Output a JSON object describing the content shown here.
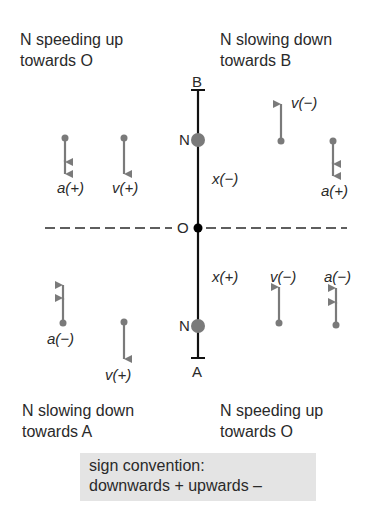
{
  "quadrants": {
    "top_left": {
      "line1": "N speeding up",
      "line2": "towards O"
    },
    "top_right": {
      "line1": "N slowing down",
      "line2": "towards B"
    },
    "bottom_left": {
      "line1": "N slowing down",
      "line2": "towards A"
    },
    "bottom_right": {
      "line1": "N speeding up",
      "line2": "towards O"
    }
  },
  "axis": {
    "top_end": "B",
    "bottom_end": "A",
    "origin": "O",
    "upper_point": "N",
    "lower_point": "N",
    "upper_displacement": "x(−)",
    "lower_displacement": "x(+)"
  },
  "vectors": {
    "top_left": [
      {
        "label": "a(+)",
        "direction": "down",
        "heads": 2
      },
      {
        "label": "v(+)",
        "direction": "down",
        "heads": 1
      }
    ],
    "top_right": [
      {
        "label": "v(−)",
        "direction": "up",
        "heads": 1
      },
      {
        "label": "a(+)",
        "direction": "down",
        "heads": 2
      }
    ],
    "bottom_left": [
      {
        "label": "a(−)",
        "direction": "up",
        "heads": 2
      },
      {
        "label": "v(+)",
        "direction": "down",
        "heads": 1
      }
    ],
    "bottom_right": [
      {
        "label": "v(−)",
        "direction": "up",
        "heads": 1
      },
      {
        "label": "a(−)",
        "direction": "up",
        "heads": 2
      }
    ]
  },
  "sign_convention": {
    "line1": "sign convention:",
    "line2": "downwards + upwards –"
  },
  "colors": {
    "axis": "#111111",
    "point": "#7a7a7a",
    "vector": "#7a7a7a",
    "convention_bg": "#e4e4e4"
  }
}
